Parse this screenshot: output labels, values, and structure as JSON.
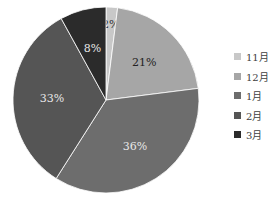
{
  "chart_data": {
    "type": "pie",
    "title": "",
    "categories": [
      "11月",
      "12月",
      "1月",
      "2月",
      "3月"
    ],
    "values": [
      2,
      21,
      36,
      33,
      8
    ],
    "labels": [
      "2%",
      "21%",
      "36%",
      "33%",
      "8%"
    ],
    "colors": [
      "#c8c8c8",
      "#a6a6a6",
      "#6d6d6d",
      "#555555",
      "#2b2b2b"
    ],
    "label_colors": [
      "#333333",
      "#222222",
      "#e8e8e8",
      "#e8e8e8",
      "#e8e8e8"
    ],
    "start_angle": "top, clockwise",
    "legend_position": "right"
  },
  "legend": {
    "items": [
      {
        "label": "11月",
        "color": "#c8c8c8"
      },
      {
        "label": "12月",
        "color": "#a6a6a6"
      },
      {
        "label": "1月",
        "color": "#6d6d6d"
      },
      {
        "label": "2月",
        "color": "#555555"
      },
      {
        "label": "3月",
        "color": "#2b2b2b"
      }
    ]
  }
}
